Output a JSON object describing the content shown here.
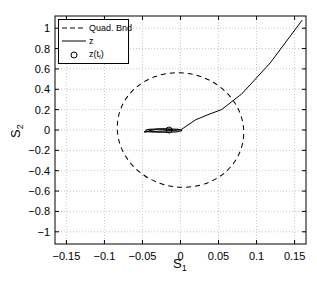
{
  "chart_data": {
    "type": "line",
    "title": "",
    "xlabel": "S",
    "xlabel_sub": "1",
    "ylabel": "S",
    "ylabel_sub": "2",
    "xlim": [
      -0.165,
      0.165
    ],
    "ylim": [
      -1.12,
      1.12
    ],
    "grid": true,
    "legend_position": "upper left",
    "xticks": [
      -0.15,
      -0.1,
      -0.05,
      0,
      0.05,
      0.1,
      0.15
    ],
    "xtick_labels": [
      "−0.15",
      "−0.1",
      "−0.05",
      "0",
      "0.05",
      "0.1",
      "0.15"
    ],
    "yticks": [
      1,
      0.8,
      0.6,
      0.4,
      0.2,
      0,
      -0.2,
      -0.4,
      -0.6,
      -0.8,
      -1
    ],
    "ytick_labels": [
      "1",
      "0.8",
      "0.6",
      "0.4",
      "0.2",
      "0",
      "−0.2",
      "−0.4",
      "−0.6",
      "−0.8",
      "−1"
    ],
    "series": [
      {
        "name": "Quad. Bnd",
        "style": "dashed",
        "shape": "ellipse",
        "center": [
          0.0,
          0.0
        ],
        "x_extent": [
          -0.084,
          0.083
        ],
        "y_extent": [
          -0.56,
          0.56
        ],
        "tilt_note": "slightly rotated; top near S1=0.015, bottom near S1=-0.015"
      },
      {
        "name": "z",
        "style": "solid",
        "points": [
          [
            0.16,
            1.08
          ],
          [
            0.118,
            0.66
          ],
          [
            0.08,
            0.35
          ],
          [
            0.078,
            0.34
          ],
          [
            0.054,
            0.2
          ],
          [
            0.036,
            0.15
          ],
          [
            0.02,
            0.1
          ],
          [
            0.0,
            0.0
          ],
          [
            -0.036,
            -0.015
          ],
          [
            -0.048,
            -0.02
          ],
          [
            -0.03,
            0.01
          ],
          [
            -0.01,
            0.005
          ],
          [
            -0.015,
            0.0
          ]
        ]
      },
      {
        "name": "z(t_f)",
        "style": "marker-circle",
        "points": [
          [
            -0.015,
            0.0
          ]
        ]
      }
    ],
    "legend": [
      {
        "label": "Quad. Bnd",
        "style": "dashed"
      },
      {
        "label": "z",
        "style": "solid"
      },
      {
        "label": "z(t",
        "label_sub": "f",
        "label_end": ")",
        "style": "circle"
      }
    ]
  }
}
